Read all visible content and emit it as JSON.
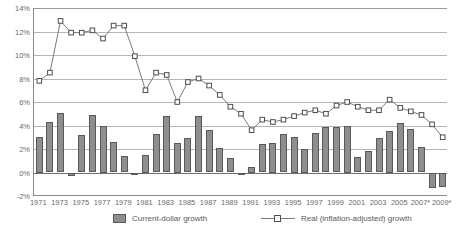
{
  "chart_data": {
    "type": "bar",
    "title": "",
    "subtitle": "",
    "xlabel": "",
    "ylabel": "",
    "ylim": [
      -2,
      14
    ],
    "ytick_step": 2,
    "yticks": [
      "14%",
      "12%",
      "10%",
      "8%",
      "6%",
      "4%",
      "2%",
      "0%",
      "-2%"
    ],
    "ytick_values": [
      14,
      12,
      10,
      8,
      6,
      4,
      2,
      0,
      -2
    ],
    "grid": true,
    "legend_position": "bottom",
    "categories": [
      "1971",
      "1972",
      "1973",
      "1974",
      "1975",
      "1976",
      "1977",
      "1978",
      "1979",
      "1980",
      "1981",
      "1982",
      "1983",
      "1984",
      "1985",
      "1986",
      "1987",
      "1988",
      "1989",
      "1990",
      "1991",
      "1992",
      "1993",
      "1994",
      "1995",
      "1996",
      "1997",
      "1998",
      "1999",
      "2000",
      "2001",
      "2002",
      "2003",
      "2004",
      "2005",
      "2006",
      "2007*",
      "2008*",
      "2009*"
    ],
    "xtick_labels": [
      "1971",
      "1973",
      "1975",
      "1977",
      "1979",
      "1981",
      "1983",
      "1985",
      "1987",
      "1989",
      "1991",
      "1993",
      "1995",
      "1997",
      "1999",
      "2001",
      "2003",
      "2005",
      "2007*",
      "2009*"
    ],
    "series": [
      {
        "name": "Current-dollar growth",
        "type": "bar",
        "values": [
          3.0,
          4.3,
          5.1,
          -0.3,
          3.2,
          4.9,
          4.0,
          2.6,
          1.4,
          -0.1,
          1.5,
          3.3,
          4.8,
          2.5,
          2.9,
          4.8,
          3.6,
          2.1,
          1.2,
          -0.2,
          0.5,
          2.4,
          2.5,
          3.3,
          3.0,
          2.0,
          3.4,
          3.9,
          3.9,
          4.0,
          1.3,
          1.8,
          2.9,
          3.5,
          4.2,
          3.7,
          2.2,
          -1.3,
          -1.2
        ]
      },
      {
        "name": "Real (inflation-adjusted) growth",
        "type": "line",
        "marker": "square",
        "values": [
          7.8,
          8.5,
          12.9,
          11.9,
          11.9,
          12.1,
          11.4,
          12.5,
          12.5,
          9.9,
          7.0,
          8.5,
          8.3,
          6.0,
          7.7,
          8.0,
          7.4,
          6.6,
          5.6,
          5.0,
          3.6,
          4.5,
          4.3,
          4.5,
          4.8,
          5.1,
          5.3,
          5.0,
          5.7,
          6.0,
          5.6,
          5.3,
          5.3,
          6.2,
          5.5,
          5.2,
          4.9,
          4.1,
          3.0
        ]
      }
    ]
  },
  "legend": {
    "bars_label": "Current-dollar growth",
    "line_label": "Real (inflation-adjusted) growth"
  }
}
